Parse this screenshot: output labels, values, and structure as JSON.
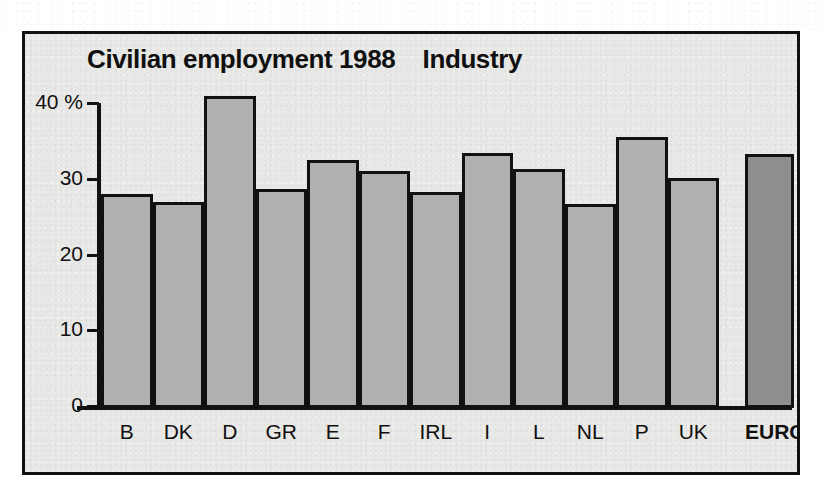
{
  "chart_data": {
    "type": "bar",
    "title": "Civilian employment 1988    Industry",
    "title_main": "Civilian employment 1988",
    "title_series": "Industry",
    "xlabel": "",
    "ylabel": "",
    "y_unit": "%",
    "ylim": [
      0,
      40
    ],
    "yticks": [
      0,
      10,
      20,
      30,
      40
    ],
    "ytick_labels": [
      "0",
      "10",
      "20",
      "30",
      "40 %"
    ],
    "grid": false,
    "legend": false,
    "categories": [
      "B",
      "DK",
      "D",
      "GR",
      "E",
      "F",
      "IRL",
      "I",
      "L",
      "NL",
      "P",
      "UK",
      "EURO 12"
    ],
    "values": [
      28.0,
      26.9,
      40.9,
      28.6,
      32.5,
      31.0,
      28.3,
      33.4,
      31.3,
      26.7,
      35.5,
      30.1,
      33.3
    ],
    "highlight_category": "EURO 12",
    "bar_fill": "#b0b0b0",
    "bar_fill_highlight": "#8e8e8e",
    "bar_outline": "#111111",
    "plot_background": "#e8e8e6",
    "frame_color": "#111111"
  },
  "axis": {
    "ticks": [
      {
        "value": 40,
        "label": "40 %"
      },
      {
        "value": 30,
        "label": "30"
      },
      {
        "value": 20,
        "label": "20"
      },
      {
        "value": 10,
        "label": "10"
      },
      {
        "value": 0,
        "label": "0"
      }
    ]
  }
}
